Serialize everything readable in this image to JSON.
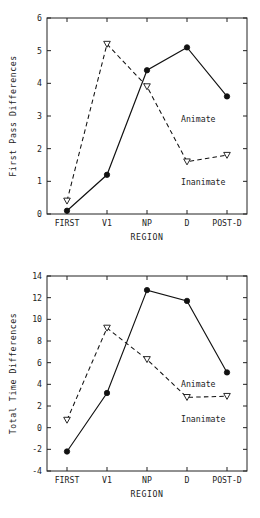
{
  "chart_data": [
    {
      "type": "line",
      "title": "",
      "xlabel": "REGION",
      "ylabel": "First Pass Differences",
      "categories": [
        "FIRST",
        "V1",
        "NP",
        "D",
        "POST-D"
      ],
      "ylim": [
        0,
        6
      ],
      "yticks": [
        0,
        1,
        2,
        3,
        4,
        5,
        6
      ],
      "ytick_labels": [
        "0",
        "1",
        "2",
        "3",
        "4",
        "5",
        "6"
      ],
      "grid": false,
      "legend_position": "inline-annotation",
      "series": [
        {
          "name": "Animate",
          "marker": "filled-circle",
          "linestyle": "solid",
          "values": [
            0.1,
            1.2,
            4.4,
            5.1,
            3.6
          ],
          "annotation": "Animate"
        },
        {
          "name": "Inanimate",
          "marker": "open-triangle-down",
          "linestyle": "dashed",
          "values": [
            0.4,
            5.2,
            3.9,
            1.6,
            1.8
          ],
          "annotation": "Inanimate"
        }
      ]
    },
    {
      "type": "line",
      "title": "",
      "xlabel": "REGION",
      "ylabel": "Total Time Differences",
      "categories": [
        "FIRST",
        "V1",
        "NP",
        "D",
        "POST-D"
      ],
      "ylim": [
        -4,
        14
      ],
      "yticks": [
        -4,
        -2,
        0,
        2,
        4,
        6,
        8,
        10,
        12,
        14
      ],
      "ytick_labels": [
        "-4",
        "-2",
        "0",
        "2",
        "4",
        "6",
        "8",
        "10",
        "12",
        "14"
      ],
      "grid": false,
      "legend_position": "inline-annotation",
      "series": [
        {
          "name": "Animate",
          "marker": "filled-circle",
          "linestyle": "solid",
          "values": [
            -2.2,
            3.2,
            12.7,
            11.7,
            5.1
          ],
          "annotation": "Animate"
        },
        {
          "name": "Inanimate",
          "marker": "open-triangle-down",
          "linestyle": "dashed",
          "values": [
            0.7,
            9.2,
            6.3,
            2.8,
            2.9
          ],
          "annotation": "Inanimate"
        }
      ]
    }
  ],
  "colors": {
    "line": "#111111",
    "axis": "#222222",
    "background": "#ffffff",
    "marker_fill": "#ffffff"
  }
}
